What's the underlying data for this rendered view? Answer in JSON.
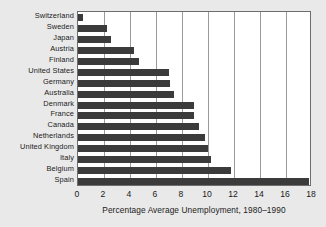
{
  "chart_data": {
    "type": "bar",
    "orientation": "horizontal",
    "title": "",
    "subtitle": "",
    "xlabel": "Percentage Average Unemployment, 1980–1990",
    "ylabel": "",
    "xlim": [
      0,
      18
    ],
    "xticks": [
      0,
      2,
      4,
      6,
      8,
      10,
      12,
      14,
      16,
      18
    ],
    "xtick_labels": [
      "0",
      "2",
      "4",
      "6",
      "8",
      "10",
      "12",
      "14",
      "16",
      "18"
    ],
    "grid": "vertical",
    "legend": "none",
    "categories": [
      "Switzerland",
      "Sweden",
      "Japan",
      "Austria",
      "Finland",
      "United States",
      "Germany",
      "Australia",
      "Denmark",
      "France",
      "Canada",
      "Netherlands",
      "United Kingdom",
      "Italy",
      "Belgium",
      "Spain"
    ],
    "values": [
      0.4,
      2.2,
      2.5,
      4.3,
      4.7,
      7.0,
      7.1,
      7.4,
      8.9,
      8.9,
      9.3,
      9.8,
      10.0,
      10.2,
      11.8,
      17.8
    ],
    "colors": {
      "bar": "#3b3b3b",
      "plot_background": "#ffffff",
      "figure_background": "#e9e9e9",
      "gridline": "#9a9a9a",
      "axis": "#6d6d6d",
      "text": "#1a1a1a"
    }
  }
}
